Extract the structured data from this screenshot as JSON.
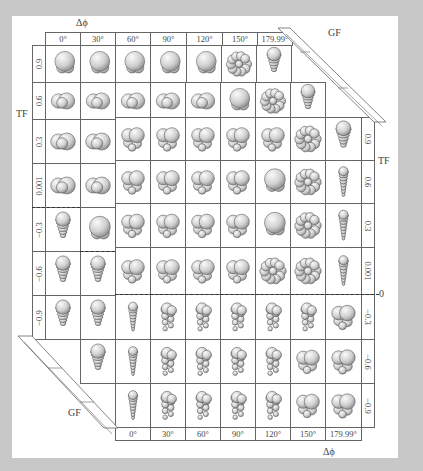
{
  "figure": {
    "top_axis_label": "Δϕ",
    "bottom_axis_label": "Δϕ",
    "left_axis_label": "TF",
    "right_axis_label": "TF",
    "top_gf_label": "GF",
    "bottom_gf_label": "GF",
    "right_zero_label": "0",
    "delta_phi_columns": [
      "0°",
      "30°",
      "60°",
      "90°",
      "120°",
      "150°",
      "179.99°"
    ],
    "tf_upper_rows": [
      "0.9",
      "0.6",
      "0.3",
      "0.001"
    ],
    "tf_lower_rows": [
      "−0.3",
      "−0.6",
      "−0.9"
    ],
    "left_tf_rows": [
      "0.9",
      "0.6",
      "0.3",
      "0.001",
      "−0.3",
      "−0.6",
      "−0.9"
    ],
    "right_tf_rows": [
      "0.9",
      "0.6",
      "0.3",
      "0.001",
      "−0.3",
      "−0.6",
      "−0.9"
    ],
    "shell_types": {
      "globular": "trochospiral globular chambers",
      "planispiral": "planispiral coiled chambers",
      "uniserial": "uniserial / conical stacked chambers",
      "biserial": "biserial / multiserial stacked chambers"
    }
  },
  "colors": {
    "background": "#c8c8c8",
    "card": "#ffffff",
    "grid_line": "#666666",
    "shell_fill": "#d9d9d9",
    "shell_edge": "#555555"
  }
}
